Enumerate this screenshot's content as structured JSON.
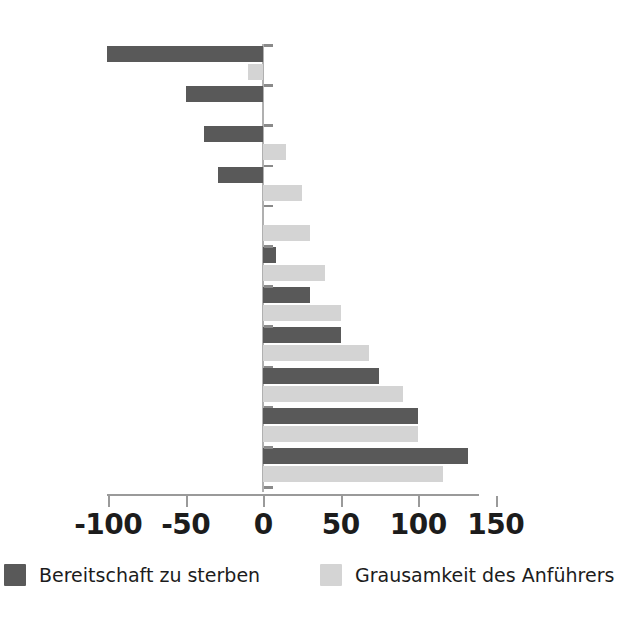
{
  "chart_data": {
    "type": "bar",
    "orientation": "horizontal",
    "title": "",
    "xlabel": "",
    "ylabel": "",
    "xlim": [
      -120,
      170
    ],
    "xticks": [
      -100,
      -50,
      0,
      50,
      100,
      150
    ],
    "xtick_labels": [
      "-100",
      "-50",
      "0",
      "50",
      "100",
      "150"
    ],
    "grid": false,
    "legend_position": "bottom",
    "categories": [
      "1",
      "2",
      "3",
      "4",
      "5",
      "6",
      "7",
      "8",
      "9",
      "10",
      "11"
    ],
    "series": [
      {
        "name": "Bereitschaft zu sterben",
        "color": "#595959",
        "values": [
          -101,
          -50,
          -38,
          -29,
          0,
          8,
          30,
          50,
          75,
          100,
          132
        ]
      },
      {
        "name": "Grausamkeit des Anführers",
        "color": "#d4d4d4",
        "values": [
          -10,
          0,
          15,
          25,
          30,
          40,
          50,
          68,
          90,
          100,
          116
        ]
      }
    ]
  },
  "legend": {
    "items": [
      {
        "label": "Bereitschaft zu sterben",
        "swatch": "dark-gray-swatch"
      },
      {
        "label": "Grausamkeit des Anführers",
        "swatch": "light-gray-swatch"
      }
    ]
  },
  "axis": {
    "tick_labels": [
      "-100",
      "-50",
      "0",
      "50",
      "100",
      "150"
    ]
  }
}
